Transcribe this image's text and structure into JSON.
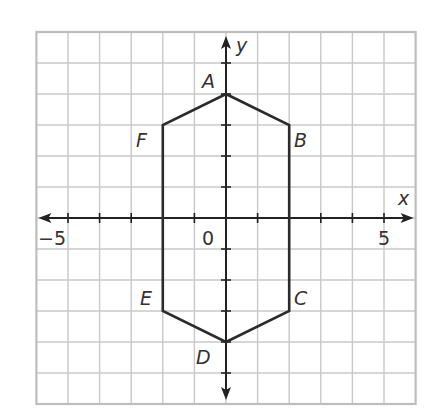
{
  "diagram": {
    "type": "coordinate-plane-polygon",
    "grid": {
      "x_min": -6,
      "x_max": 6,
      "y_min": -6,
      "y_max": 6,
      "grid_color": "#c8c8c8",
      "border_color": "#bdbdbd"
    },
    "axes": {
      "x_label": "x",
      "y_label": "y",
      "tick_labels": [
        {
          "text": "−5",
          "value": -5,
          "axis": "x"
        },
        {
          "text": "0",
          "value": 0,
          "axis": "origin"
        },
        {
          "text": "5",
          "value": 5,
          "axis": "x"
        }
      ],
      "axis_color": "#222222"
    },
    "polygon": {
      "stroke_color": "#2b2b2b",
      "vertices": [
        {
          "name": "A",
          "x": 0,
          "y": 4
        },
        {
          "name": "B",
          "x": 2,
          "y": 3
        },
        {
          "name": "C",
          "x": 2,
          "y": -3
        },
        {
          "name": "D",
          "x": 0,
          "y": -4
        },
        {
          "name": "E",
          "x": -2,
          "y": -3
        },
        {
          "name": "F",
          "x": -2,
          "y": 3
        }
      ]
    }
  }
}
